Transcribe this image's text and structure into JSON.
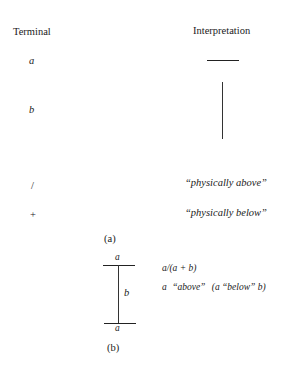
{
  "part_a": {
    "headers": {
      "terminal": "Terminal",
      "interpretation": "Interpretation"
    },
    "rows": [
      {
        "terminal": "a",
        "interpretation_type": "horizontal-line",
        "interpretation": ""
      },
      {
        "terminal": "b",
        "interpretation_type": "vertical-line",
        "interpretation": ""
      },
      {
        "terminal": "/",
        "interpretation_type": "text",
        "interpretation": "“physically above”"
      },
      {
        "terminal": "+",
        "interpretation_type": "text",
        "interpretation": "“physically below”"
      }
    ],
    "caption": "(a)"
  },
  "part_b": {
    "figure": {
      "top_label": "a",
      "middle_label": "b",
      "bottom_label": "a"
    },
    "expression": "a/(a + b)",
    "reading": {
      "a1": "a",
      "above": "“above”",
      "paren_open": "(a",
      "below": "“below”",
      "paren_close": "b)"
    },
    "caption": "(b)"
  }
}
